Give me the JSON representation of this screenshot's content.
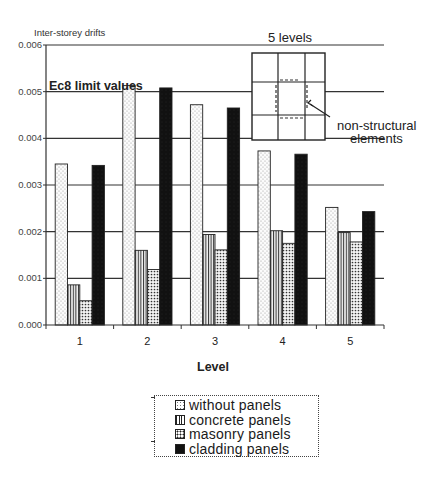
{
  "chart_data": {
    "type": "bar",
    "title": "",
    "ylabel": "Inter-storey drifts",
    "xlabel": "Level",
    "categories": [
      "1",
      "2",
      "3",
      "4",
      "5"
    ],
    "series": [
      {
        "name": "without panels",
        "pattern": "light-dots",
        "values": [
          0.00345,
          0.00513,
          0.00472,
          0.00373,
          0.00252
        ]
      },
      {
        "name": "concrete panels",
        "pattern": "vertical-stripes",
        "values": [
          0.00086,
          0.0016,
          0.00194,
          0.00202,
          0.00198
        ]
      },
      {
        "name": "masonry panels",
        "pattern": "dense-dots",
        "values": [
          0.00052,
          0.00119,
          0.00161,
          0.00175,
          0.00178
        ]
      },
      {
        "name": "cladding panels",
        "pattern": "solid-black",
        "values": [
          0.00342,
          0.00508,
          0.00465,
          0.00366,
          0.00243
        ]
      }
    ],
    "ylim": [
      0,
      0.006
    ],
    "yticks": [
      "0.000",
      "0.001",
      "0.002",
      "0.003",
      "0.004",
      "0.005",
      "0.006"
    ],
    "grid": true,
    "legend_position": "bottom",
    "annotations": [
      {
        "text": "Ec8 limit values",
        "anchor": "y=0.005 line, left"
      },
      {
        "text": "5 levels",
        "anchor": "inset title, top right"
      },
      {
        "text": "non-structural elements",
        "anchor": "inset arrow label"
      }
    ],
    "inset": {
      "description": "3x3 frame grid plan with dashed non-structural elements around the central bay"
    }
  },
  "labels": {
    "ylabel": "Inter-storey drifts",
    "xlabel": "Level",
    "limit": "Ec8 limit values",
    "inset_title": "5 levels",
    "inset_note_line1": "non-structural",
    "inset_note_line2": "elements"
  },
  "legend": [
    {
      "label": "without panels"
    },
    {
      "label": "concrete panels"
    },
    {
      "label": "masonry panels"
    },
    {
      "label": "cladding panels"
    }
  ]
}
